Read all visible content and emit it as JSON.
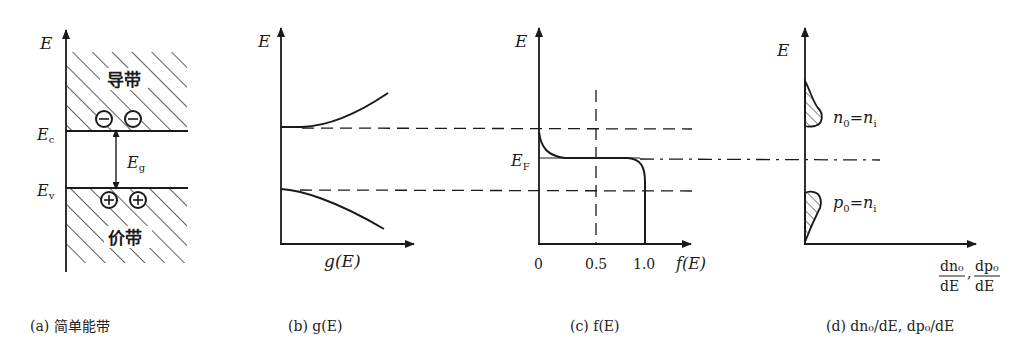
{
  "panels": {
    "a": {
      "caption": "(a) 简单能带",
      "axis_label": "E",
      "conduction_band_label": "导带",
      "valence_band_label": "价带",
      "ec_label": "E",
      "ec_sub": "c",
      "ev_label": "E",
      "ev_sub": "v",
      "eg_label": "E",
      "eg_sub": "g",
      "electron_symbol": "−",
      "hole_symbol": "+"
    },
    "b": {
      "caption": "(b) g(E)",
      "axis_label": "E",
      "x_label": "g(E)"
    },
    "c": {
      "caption": "(c) f(E)",
      "axis_label": "E",
      "ef_label": "E",
      "ef_sub": "F",
      "x_label": "f(E)",
      "ticks": [
        "0",
        "0.5",
        "1.0"
      ]
    },
    "d": {
      "caption": "(d) dn₀/dE, dp₀/dE",
      "axis_label": "E",
      "n_label": "n",
      "n_sub": "0",
      "n_eq": "=n",
      "n_eq_sub": "i",
      "p_label": "p",
      "p_sub": "0",
      "p_eq": "=n",
      "p_eq_sub": "i",
      "x_label_num1": "dn₀",
      "x_label_den1": "dE",
      "x_label_num2": "dp₀",
      "x_label_den2": "dE",
      "x_label_sep": ","
    }
  },
  "colors": {
    "ink": "#1a1a1a",
    "background": "#ffffff"
  }
}
